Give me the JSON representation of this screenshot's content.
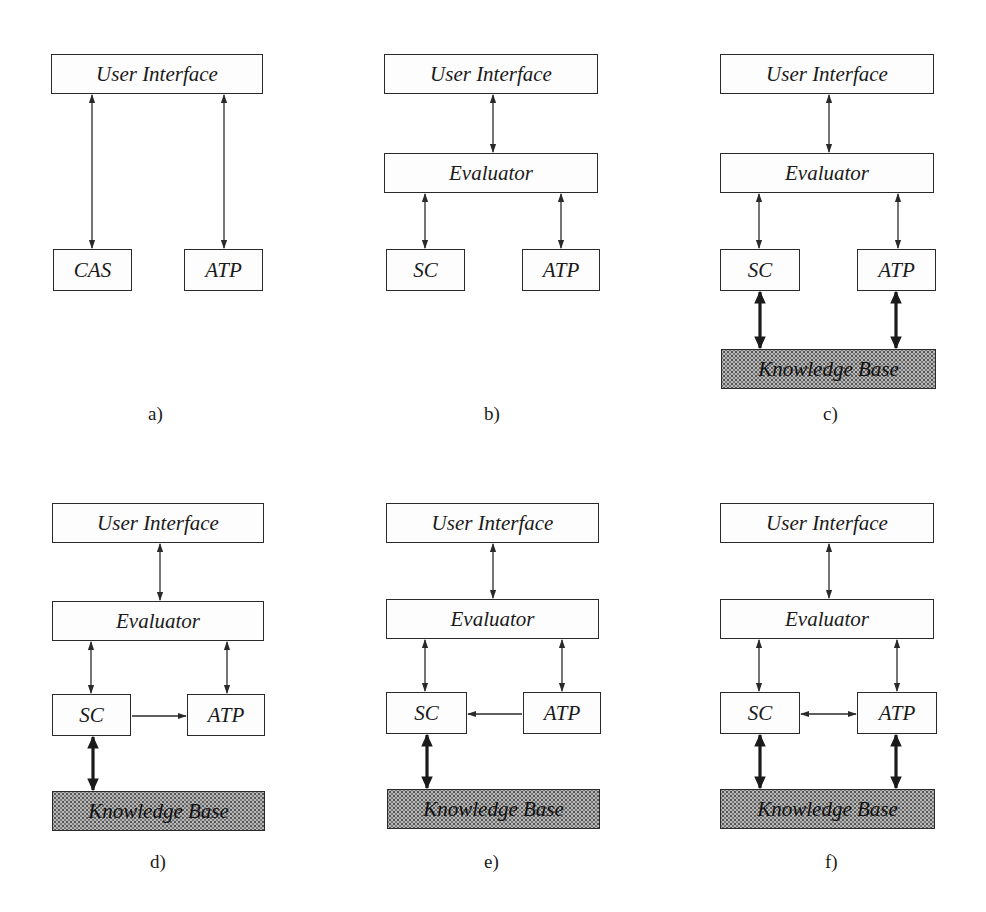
{
  "panels": [
    {
      "id": "a",
      "caption": "a)",
      "user_interface": "User Interface",
      "left": "CAS",
      "right": "ATP",
      "has_evaluator": false,
      "has_knowledge_base": false,
      "sc_atp_link": "none"
    },
    {
      "id": "b",
      "caption": "b)",
      "user_interface": "User Interface",
      "evaluator": "Evaluator",
      "left": "SC",
      "right": "ATP",
      "has_evaluator": true,
      "has_knowledge_base": false,
      "sc_atp_link": "none"
    },
    {
      "id": "c",
      "caption": "c)",
      "user_interface": "User Interface",
      "evaluator": "Evaluator",
      "left": "SC",
      "right": "ATP",
      "knowledge_base": "Knowledge Base",
      "has_evaluator": true,
      "has_knowledge_base": true,
      "kb_links": [
        "SC",
        "ATP"
      ],
      "sc_atp_link": "none"
    },
    {
      "id": "d",
      "caption": "d)",
      "user_interface": "User Interface",
      "evaluator": "Evaluator",
      "left": "SC",
      "right": "ATP",
      "knowledge_base": "Knowledge Base",
      "has_evaluator": true,
      "has_knowledge_base": true,
      "kb_links": [
        "SC"
      ],
      "sc_atp_link": "SC->ATP"
    },
    {
      "id": "e",
      "caption": "e)",
      "user_interface": "User Interface",
      "evaluator": "Evaluator",
      "left": "SC",
      "right": "ATP",
      "knowledge_base": "Knowledge Base",
      "has_evaluator": true,
      "has_knowledge_base": true,
      "kb_links": [
        "SC"
      ],
      "sc_atp_link": "ATP->SC"
    },
    {
      "id": "f",
      "caption": "f)",
      "user_interface": "User Interface",
      "evaluator": "Evaluator",
      "left": "SC",
      "right": "ATP",
      "knowledge_base": "Knowledge Base",
      "has_evaluator": true,
      "has_knowledge_base": true,
      "kb_links": [
        "SC",
        "ATP"
      ],
      "sc_atp_link": "SC<->ATP"
    }
  ],
  "colors": {
    "line": "#2a2a2a",
    "knowledge_base_fill": "#b8b8b8",
    "background": "#ffffff"
  }
}
